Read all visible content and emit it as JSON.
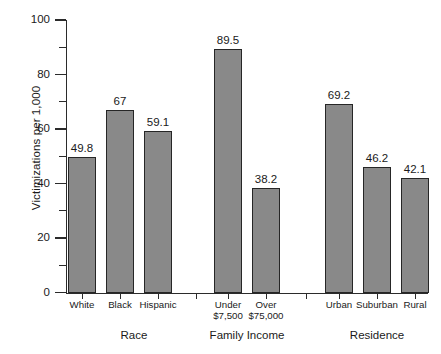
{
  "chart_data": {
    "type": "bar",
    "title": "",
    "xlabel": "",
    "ylabel": "Victimizations per 1,000",
    "ylim": [
      0,
      100
    ],
    "ytick_labels": [
      "0",
      "20",
      "40",
      "60",
      "80",
      "100"
    ],
    "ytick_values": [
      0,
      20,
      40,
      60,
      80,
      100
    ],
    "minor_tick_values": [
      10,
      30,
      50,
      70,
      90
    ],
    "grid": false,
    "legend": "none",
    "categories": [
      "White",
      "Black",
      "Hispanic",
      "Under $7,500",
      "Over $75,000",
      "Urban",
      "Suburban",
      "Rural"
    ],
    "values": [
      49.8,
      67,
      59.1,
      89.5,
      38.2,
      69.2,
      46.2,
      42.1
    ],
    "value_labels": [
      "49.8",
      "67",
      "59.1",
      "89.5",
      "38.2",
      "69.2",
      "46.2",
      "42.1"
    ],
    "groups": [
      {
        "label": "Race",
        "categories": [
          "White",
          "Black",
          "Hispanic"
        ],
        "values": [
          49.8,
          67,
          59.1
        ]
      },
      {
        "label": "Family Income",
        "categories": [
          "Under $7,500",
          "Over $75,000"
        ],
        "values": [
          89.5,
          38.2
        ]
      },
      {
        "label": "Residence",
        "categories": [
          "Urban",
          "Suburban",
          "Rural"
        ],
        "values": [
          69.2,
          46.2,
          42.1
        ]
      }
    ],
    "bar_color": "#898989",
    "bar_edge_color": "#262626",
    "axis_color": "#2b2b2b"
  },
  "bars": [
    {
      "label_line1": "White",
      "label_line2": "",
      "value_label": "49.8",
      "value": 49.8,
      "x": 68,
      "w": 28
    },
    {
      "label_line1": "Black",
      "label_line2": "",
      "value_label": "67",
      "value": 67.0,
      "x": 106,
      "w": 28
    },
    {
      "label_line1": "Hispanic",
      "label_line2": "",
      "value_label": "59.1",
      "value": 59.1,
      "x": 144,
      "w": 28
    },
    {
      "label_line1": "Under",
      "label_line2": "$7,500",
      "value_label": "89.5",
      "value": 89.5,
      "x": 214,
      "w": 28
    },
    {
      "label_line1": "Over",
      "label_line2": "$75,000",
      "value_label": "38.2",
      "value": 38.2,
      "x": 252,
      "w": 28
    },
    {
      "label_line1": "Urban",
      "label_line2": "",
      "value_label": "69.2",
      "value": 69.2,
      "x": 325,
      "w": 28
    },
    {
      "label_line1": "Suburban",
      "label_line2": "",
      "value_label": "46.2",
      "value": 46.2,
      "x": 363,
      "w": 28
    },
    {
      "label_line1": "Rural",
      "label_line2": "",
      "value_label": "42.1",
      "value": 42.1,
      "x": 401,
      "w": 28
    }
  ],
  "groups": [
    {
      "label": "Race",
      "center": 134
    },
    {
      "label": "Family Income",
      "center": 247
    },
    {
      "label": "Residence",
      "center": 377
    }
  ],
  "axis": {
    "y_label": "Victimizations per 1,000",
    "y_ticks": [
      "100",
      "80",
      "60",
      "40",
      "20",
      "0"
    ]
  }
}
